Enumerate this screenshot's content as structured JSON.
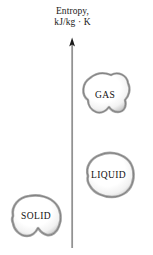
{
  "figure": {
    "axis": {
      "label_line1": "Entropy,",
      "label_line2": "kJ/kg · K",
      "direction": "up",
      "line_color": "#6f6f6f",
      "arrow_color": "#1a1a1a"
    },
    "blobs": [
      {
        "id": "gas",
        "label": "GAS",
        "fill_color": "#ffffff",
        "edge_color": "#9a9a9a"
      },
      {
        "id": "liquid",
        "label": "LIQUID",
        "fill_color": "#ffffff",
        "edge_color": "#9a9a9a"
      },
      {
        "id": "solid",
        "label": "SOLID",
        "fill_color": "#ffffff",
        "edge_color": "#9a9a9a"
      }
    ],
    "background_color": "#ffffff"
  }
}
